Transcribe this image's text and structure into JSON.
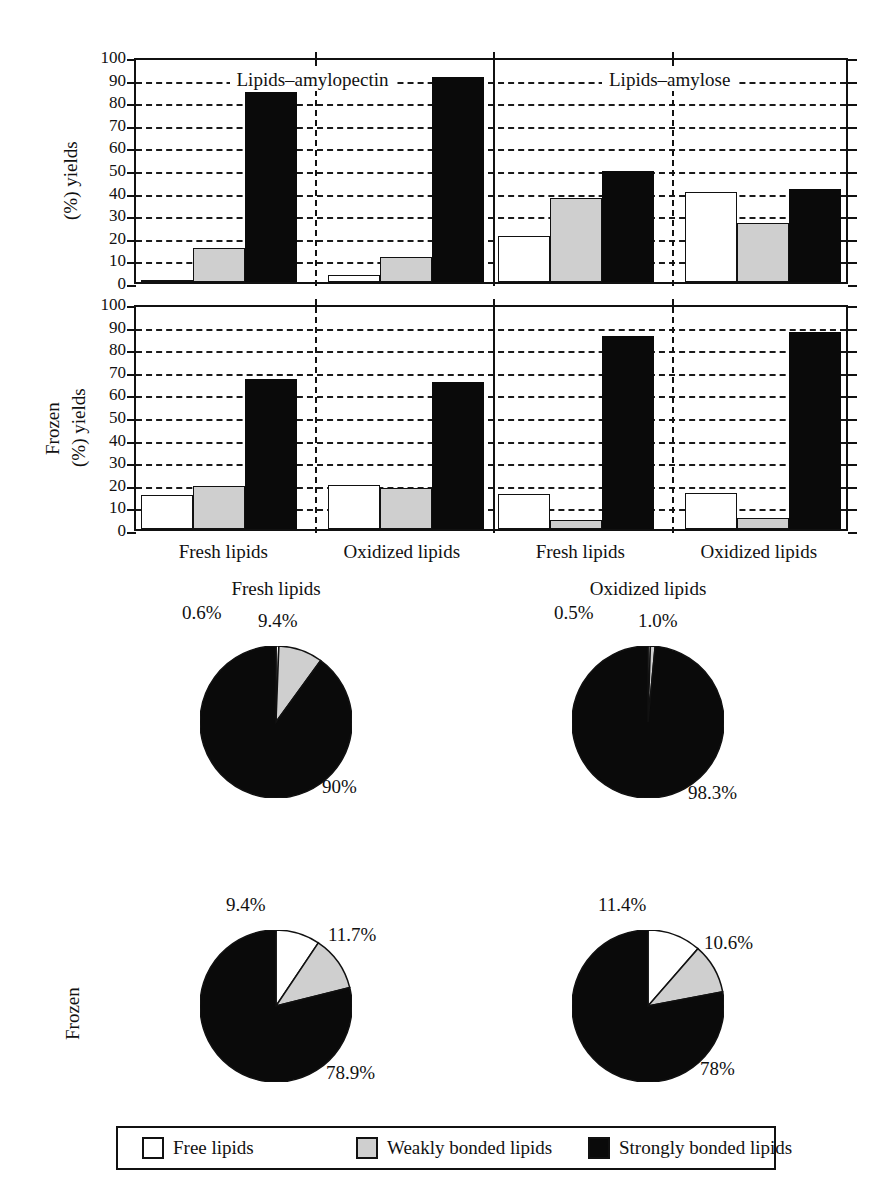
{
  "figure": {
    "axis": {
      "y_ticks": [
        "0",
        "10",
        "20",
        "30",
        "40",
        "50",
        "60",
        "70",
        "80",
        "90",
        "100"
      ],
      "ylim": [
        0,
        100
      ]
    },
    "panel_titles": {
      "left": "Lipids–amylopectin",
      "right": "Lipids–amylose"
    },
    "y_axis_labels": {
      "top": "(%) yields",
      "bottom_line1": "Frozen",
      "bottom_line2": "(%) yields"
    },
    "x_labels": [
      "Fresh lipids",
      "Oxidized lipids",
      "Fresh lipids",
      "Oxidized lipids"
    ],
    "frozen_pie_row_label": "Frozen",
    "legend": {
      "items": [
        {
          "label": "Free lipids",
          "color": "#ffffff",
          "key": "free"
        },
        {
          "label": "Weakly bonded lipids",
          "color": "#cfcfcf",
          "key": "weak"
        },
        {
          "label": "Strongly bonded lipids",
          "color": "#0a0a0a",
          "key": "strong"
        }
      ]
    }
  },
  "chart_data": [
    {
      "type": "bar",
      "title": "",
      "ylabel": "(%) yields",
      "xlabel": "",
      "ylim": [
        0,
        100
      ],
      "grid": true,
      "panels": [
        "Lipids–amylopectin",
        "Lipids–amylose"
      ],
      "categories": [
        "Fresh lipids",
        "Oxidized lipids",
        "Fresh lipids",
        "Oxidized lipids"
      ],
      "series": [
        {
          "name": "Free lipids",
          "values": [
            1,
            3,
            20.5,
            40
          ]
        },
        {
          "name": "Weakly bonded lipids",
          "values": [
            15,
            11,
            37,
            26
          ]
        },
        {
          "name": "Strongly bonded lipids",
          "values": [
            84,
            90.5,
            49,
            41
          ]
        }
      ]
    },
    {
      "type": "bar",
      "title": "",
      "ylabel": "Frozen (%) yields",
      "xlabel": "",
      "ylim": [
        0,
        100
      ],
      "grid": true,
      "panels": [
        "Lipids–amylopectin",
        "Lipids–amylose"
      ],
      "categories": [
        "Fresh lipids",
        "Oxidized lipids",
        "Fresh lipids",
        "Oxidized lipids"
      ],
      "series": [
        {
          "name": "Free lipids",
          "values": [
            15,
            19.5,
            15.5,
            16
          ]
        },
        {
          "name": "Weakly bonded lipids",
          "values": [
            19,
            18,
            4,
            5
          ]
        },
        {
          "name": "Strongly bonded lipids",
          "values": [
            66.5,
            65,
            85.5,
            87
          ]
        }
      ]
    },
    {
      "type": "pie",
      "title": "Fresh lipids",
      "labels": [
        "Free lipids",
        "Weakly bonded lipids",
        "Strongly bonded lipids"
      ],
      "values": [
        0.6,
        9.4,
        90
      ],
      "display_labels": [
        "0.6%",
        "9.4%",
        "90%"
      ],
      "colors": [
        "#ffffff",
        "#cfcfcf",
        "#0a0a0a"
      ]
    },
    {
      "type": "pie",
      "title": "Oxidized lipids",
      "labels": [
        "Free lipids",
        "Weakly bonded lipids",
        "Strongly bonded lipids"
      ],
      "values": [
        0.5,
        1.0,
        98.3
      ],
      "display_labels": [
        "0.5%",
        "1.0%",
        "98.3%"
      ],
      "colors": [
        "#ffffff",
        "#cfcfcf",
        "#0a0a0a"
      ]
    },
    {
      "type": "pie",
      "title": "",
      "row": "Frozen",
      "labels": [
        "Free lipids",
        "Weakly bonded lipids",
        "Strongly bonded lipids"
      ],
      "values": [
        9.4,
        11.7,
        78.9
      ],
      "display_labels": [
        "9.4%",
        "11.7%",
        "78.9%"
      ],
      "colors": [
        "#ffffff",
        "#cfcfcf",
        "#0a0a0a"
      ]
    },
    {
      "type": "pie",
      "title": "",
      "row": "Frozen",
      "labels": [
        "Free lipids",
        "Weakly bonded lipids",
        "Strongly bonded lipids"
      ],
      "values": [
        11.4,
        10.6,
        78
      ],
      "display_labels": [
        "11.4%",
        "10.6%",
        "78%"
      ],
      "colors": [
        "#ffffff",
        "#cfcfcf",
        "#0a0a0a"
      ]
    }
  ]
}
